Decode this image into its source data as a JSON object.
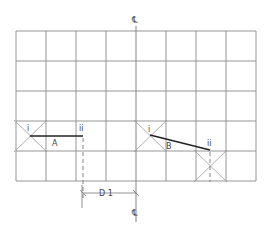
{
  "diagram": {
    "grid": {
      "x0": 16,
      "y0": 31,
      "cols": 8,
      "rows": 5,
      "cell": 30,
      "color": "#8a8a8a"
    },
    "centerline": {
      "symbol": "℄",
      "x": 136
    },
    "members": [
      {
        "label": "A",
        "start_label": "i",
        "end_label": "ii"
      },
      {
        "label": "B",
        "start_label": "i",
        "end_label": "ii"
      }
    ],
    "dimension": {
      "label": "D 1"
    }
  }
}
